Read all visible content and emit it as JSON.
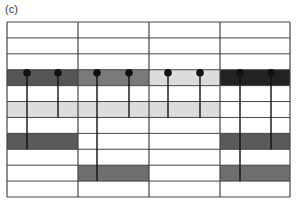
{
  "figure": {
    "label": "(c)",
    "grid": {
      "left": 7,
      "right": 290,
      "top": 22,
      "bottom": 197,
      "rows": 11,
      "columns": [
        7,
        78,
        149,
        220,
        290
      ],
      "line_color": "#444444"
    },
    "shaded_cells": [
      {
        "row": 3,
        "col": 0,
        "color": "#555555"
      },
      {
        "row": 3,
        "col": 1,
        "color": "#7a7a7a"
      },
      {
        "row": 3,
        "col": 2,
        "color": "#dcdcdc"
      },
      {
        "row": 3,
        "col": 3,
        "color": "#222222"
      },
      {
        "row": 5,
        "col": 0,
        "color": "#dcdcdc"
      },
      {
        "row": 5,
        "col": 1,
        "color": "#dcdcdc"
      },
      {
        "row": 5,
        "col": 2,
        "color": "#dcdcdc"
      },
      {
        "row": 7,
        "col": 0,
        "color": "#5a5a5a"
      },
      {
        "row": 7,
        "col": 3,
        "color": "#5a5a5a"
      },
      {
        "row": 9,
        "col": 1,
        "color": "#6e6e6e"
      },
      {
        "row": 9,
        "col": 3,
        "color": "#6e6e6e"
      }
    ],
    "pins": [
      {
        "x": 27,
        "end_row": 7
      },
      {
        "x": 58,
        "end_row": 5
      },
      {
        "x": 97,
        "end_row": 9
      },
      {
        "x": 129,
        "end_row": 5
      },
      {
        "x": 168,
        "end_row": 5
      },
      {
        "x": 200,
        "end_row": 5
      },
      {
        "x": 240,
        "end_row": 9
      },
      {
        "x": 271,
        "end_row": 7
      }
    ],
    "pin_row": 3,
    "pin_color": "#111111"
  }
}
